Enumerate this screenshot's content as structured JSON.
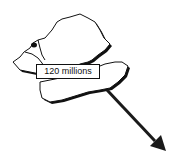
{
  "map": {
    "label": "120 millions",
    "colors": {
      "outline": "#111111",
      "fill": "#ffffff",
      "arrow": "#1a1a1a"
    }
  }
}
